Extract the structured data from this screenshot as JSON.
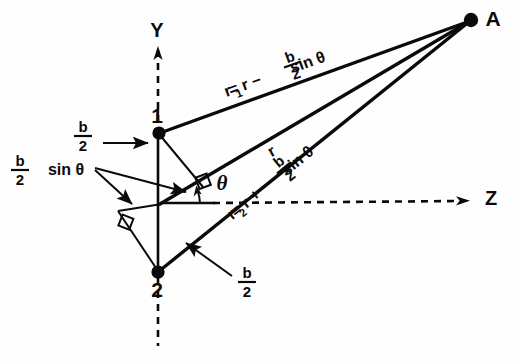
{
  "figure": {
    "background_color": "#fefefe",
    "ink_color": "#0a0a0a"
  },
  "axes": {
    "y_label": "Y",
    "z_label": "Z",
    "y_axis_name": "vertical-axis",
    "z_axis_name": "horizontal-axis"
  },
  "points": {
    "source_top_label": "1",
    "source_bottom_label": "2",
    "far_field_label": "A"
  },
  "angle": {
    "theta_label": "θ"
  },
  "labels": {
    "r1_prefix": "r",
    "r1_sub": "1",
    "r1_eq": " = r −",
    "r_middle": "r",
    "r2_prefix": "r",
    "r2_sub": "2",
    "r2_eq": " = r +",
    "sin_theta": "sin θ",
    "b_over_2_top": "b/2",
    "b_over_2_bottom": "b/2",
    "b_over_2_sin_theta": "b/2 sin θ"
  },
  "fractions": {
    "numerator": "b",
    "denominator": "2"
  },
  "equations": {
    "r1_full": "r₁ = r − (b/2) sin θ",
    "r2_full": "r₂ = r + (b/2) sin θ",
    "r_full": "r"
  },
  "geometry": {
    "origin_x": 160,
    "origin_y": 204,
    "point1_x": 158,
    "point1_y": 133,
    "point2_x": 158,
    "point2_y": 272,
    "pointA_x": 473,
    "pointA_y": 20,
    "theta_degrees": 25
  }
}
